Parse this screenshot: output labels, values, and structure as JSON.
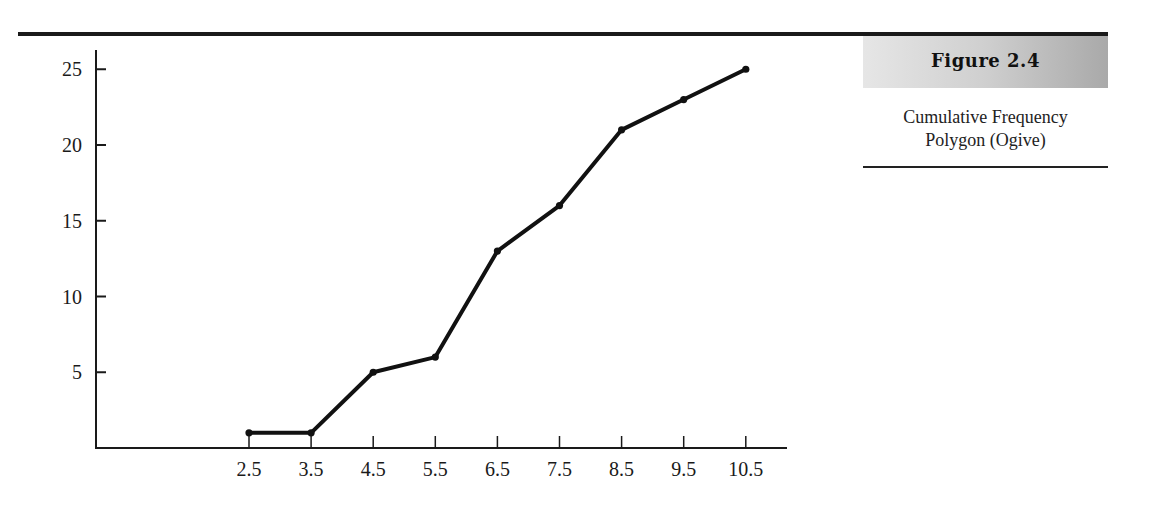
{
  "figure": {
    "label": "Figure 2.4",
    "caption_line1": "Cumulative Frequency",
    "caption_line2": "Polygon (Ogive)"
  },
  "chart_data": {
    "type": "line",
    "title": "Cumulative Frequency Polygon (Ogive)",
    "xlabel": "",
    "ylabel": "",
    "x": [
      2.5,
      3.5,
      4.5,
      5.5,
      6.5,
      7.5,
      8.5,
      9.5,
      10.5
    ],
    "x_tick_labels": [
      "2.5",
      "3.5",
      "4.5",
      "5.5",
      "6.5",
      "7.5",
      "8.5",
      "9.5",
      "10.5"
    ],
    "y_ticks": [
      5,
      10,
      15,
      20,
      25
    ],
    "y_tick_labels": [
      "5",
      "10",
      "15",
      "20",
      "25"
    ],
    "series": [
      {
        "name": "Cumulative frequency",
        "values": [
          1,
          1,
          5,
          6,
          13,
          16,
          21,
          23,
          25
        ]
      }
    ],
    "ylim": [
      0,
      26
    ],
    "grid": false,
    "markers": true,
    "line_color": "#111111"
  }
}
